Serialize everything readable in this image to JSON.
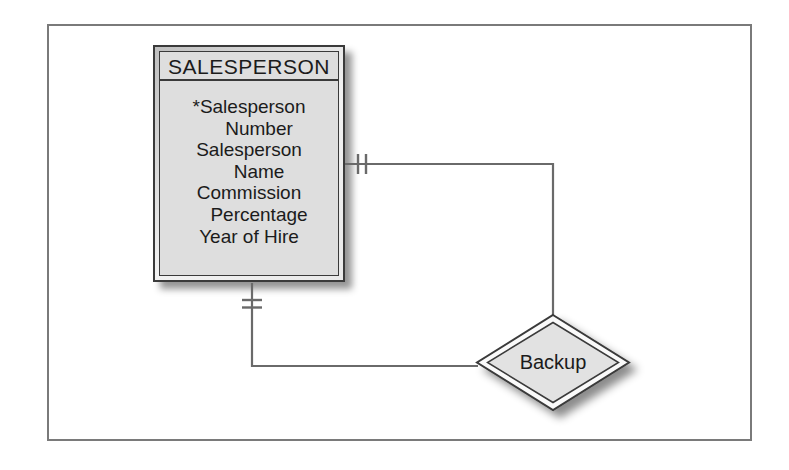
{
  "figure": {
    "type": "entity-relationship-diagram"
  },
  "entity": {
    "title": "SALESPERSON",
    "attribute_lines": [
      "*Salesperson",
      "Number",
      "Salesperson",
      "Name",
      "Commission",
      "Percentage",
      "Year of Hire"
    ]
  },
  "relationship": {
    "label": "Backup"
  },
  "connectors": {
    "right_connector_ticks": 2,
    "bottom_connector_ticks": 2
  },
  "colors": {
    "page_background": "#ffffff",
    "frame_color": "#7a7a7a",
    "entity_fill": "#dedede",
    "entity_border_color": "#3a3a3a",
    "entity_text_color": "#1b1b1b",
    "relationship_fill": "#e2e2e2",
    "line_color": "#6a6a6a"
  }
}
